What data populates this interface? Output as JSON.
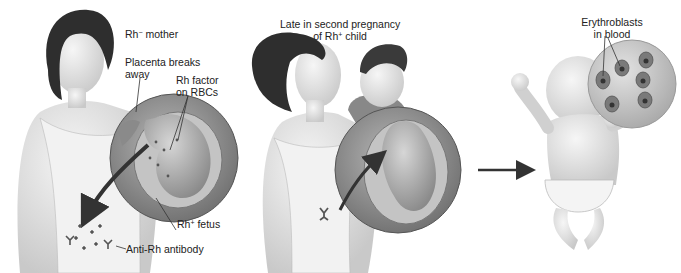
{
  "panels": [
    {
      "id": "first-pregnancy",
      "labels": {
        "mother": {
          "prefix": "Rh",
          "sup": "−",
          "suffix": " mother"
        },
        "placenta_line1": "Placenta breaks",
        "placenta_line2": "away",
        "rh_factor_line1": "Rh factor",
        "rh_factor_line2": "on RBCs",
        "fetus": {
          "prefix": "Rh",
          "sup": "+",
          "suffix": " fetus"
        },
        "antibody": "Anti-Rh antibody"
      }
    },
    {
      "id": "second-pregnancy",
      "labels": {
        "title_line1": "Late in second pregnancy",
        "title_line2": {
          "prefix": "of Rh",
          "sup": "+",
          "suffix": " child"
        }
      }
    },
    {
      "id": "newborn",
      "labels": {
        "erythro_line1": "Erythroblasts",
        "erythro_line2": "in blood"
      }
    }
  ],
  "colors": {
    "ink": "#222222",
    "skin": "#e6e6e6",
    "circle": "#9a9a9a",
    "hair": "#2e2e2e"
  }
}
